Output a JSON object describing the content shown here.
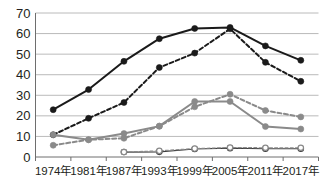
{
  "chart_data": {
    "type": "line",
    "title": "",
    "subtitle": "",
    "xlabel": "",
    "ylabel": "",
    "categories": [
      "1974年",
      "1981年",
      "1987年",
      "1993年",
      "1999年",
      "2005年",
      "2011年",
      "2017年"
    ],
    "x_tick_labels": [
      "1974年",
      "1981年",
      "1987年",
      "1993年",
      "1999年",
      "2005年",
      "2011年",
      "2017年"
    ],
    "y_tick_labels": [
      "0",
      "10",
      "20",
      "30",
      "40",
      "50",
      "60",
      "70"
    ],
    "y_ticks": [
      0,
      10,
      20,
      30,
      40,
      50,
      60,
      70
    ],
    "ylim": [
      0,
      70
    ],
    "grid": "horizontal",
    "legend": "none",
    "series": [
      {
        "name": "series-1-dark-solid",
        "color": "#1a1a1a",
        "line_style": "solid",
        "marker": "filled-circle",
        "values": [
          23,
          32.8,
          46.5,
          57.5,
          62.5,
          63,
          54,
          47
        ]
      },
      {
        "name": "series-2-dark-dashed",
        "color": "#1a1a1a",
        "line_style": "dashed",
        "marker": "filled-circle",
        "values": [
          10.8,
          18.8,
          26.5,
          43.5,
          50.5,
          62.3,
          46,
          36.8
        ]
      },
      {
        "name": "series-3-gray-solid",
        "color": "#8a8a8a",
        "line_style": "solid",
        "marker": "filled-circle",
        "values": [
          10.8,
          8.4,
          11.4,
          15,
          27,
          27,
          14.8,
          13.6
        ]
      },
      {
        "name": "series-4-gray-dashed",
        "color": "#8a8a8a",
        "line_style": "dashed",
        "marker": "filled-circle",
        "values": [
          5.7,
          8.4,
          9.1,
          15,
          24.4,
          30.5,
          22.6,
          19.5
        ]
      },
      {
        "name": "series-5-low-solid",
        "color": "#3d3d3d",
        "line_style": "solid",
        "marker": "open-circle",
        "values": [
          null,
          null,
          2.4,
          2.5,
          3.9,
          4.3,
          4.0,
          4.0
        ]
      },
      {
        "name": "series-6-low-dashed",
        "color": "#8a8a8a",
        "line_style": "dashed",
        "marker": "open-circle",
        "values": [
          null,
          null,
          2.4,
          3.0,
          4.1,
          4.6,
          4.5,
          4.5
        ]
      }
    ],
    "colors": {
      "dark": "#1a1a1a",
      "gray": "#8a8a8a",
      "grid": "#a8a8a8",
      "axis": "#6e6e6e",
      "text": "#231f20",
      "background": "#ffffff"
    }
  }
}
